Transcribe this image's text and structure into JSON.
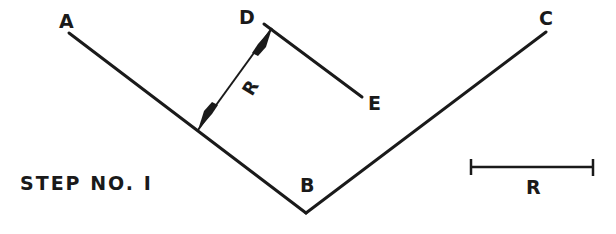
{
  "diagram": {
    "title": "STEP NO. I",
    "colors": {
      "ink": "#1a1a1a",
      "background": "#ffffff"
    },
    "points": {
      "A": {
        "label": "A",
        "x": 69,
        "y": 33
      },
      "B": {
        "label": "B",
        "x": 306,
        "y": 213
      },
      "C": {
        "label": "C",
        "x": 546,
        "y": 32
      },
      "D": {
        "label": "D",
        "x": 268,
        "y": 27
      },
      "E": {
        "label": "E",
        "x": 362,
        "y": 97
      }
    },
    "lines": [
      {
        "name": "line-AB",
        "from": "A",
        "to": "B"
      },
      {
        "name": "line-CB",
        "from": "C",
        "to": "B"
      },
      {
        "name": "line-DE",
        "from": "D",
        "to": "E",
        "note": "parallel to AB at distance R"
      }
    ],
    "dimension": {
      "label": "R",
      "description": "perpendicular distance R from line AB to line DE",
      "from": {
        "x": 198,
        "y": 130
      },
      "to": {
        "x": 272,
        "y": 29
      }
    },
    "scale_bar": {
      "label": "R",
      "x1": 471,
      "x2": 593,
      "y": 167
    }
  }
}
